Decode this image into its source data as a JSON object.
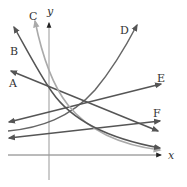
{
  "figure": {
    "axes": {
      "x_label": "x",
      "y_label": "y"
    },
    "curves": [
      {
        "id": "A",
        "label": "A",
        "kind": "line",
        "trend": "decreasing",
        "color": "#555555"
      },
      {
        "id": "B",
        "label": "B",
        "kind": "exponential-decay",
        "trend": "decreasing",
        "color": "#555555"
      },
      {
        "id": "C",
        "label": "C",
        "kind": "exponential-decay",
        "trend": "decreasing",
        "color": "#aaaaaa"
      },
      {
        "id": "D",
        "label": "D",
        "kind": "exponential-growth",
        "trend": "increasing",
        "color": "#666666"
      },
      {
        "id": "E",
        "label": "E",
        "kind": "line",
        "trend": "increasing",
        "color": "#555555"
      },
      {
        "id": "F",
        "label": "F",
        "kind": "line",
        "trend": "increasing",
        "color": "#555555"
      }
    ]
  },
  "colors": {
    "axis": "#777777",
    "dark_curve": "#555555",
    "light_curve": "#aaaaaa",
    "background": "#ffffff"
  }
}
